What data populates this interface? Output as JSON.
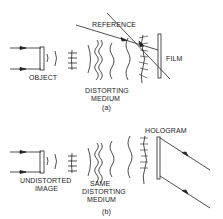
{
  "panel_a": {
    "caption": "(a)",
    "labels": {
      "object": "OBJECT",
      "distorting_medium_line1": "DISTORTING",
      "distorting_medium_line2": "MEDIUM",
      "reference": "REFERENCE",
      "film": "FILM"
    }
  },
  "panel_b": {
    "caption": "(b)",
    "labels": {
      "undistorted_line1": "UNDISTORTED",
      "undistorted_line2": "IMAGE",
      "same_line1": "SAME",
      "same_line2": "DISTORTING",
      "same_line3": "MEDIUM",
      "hologram": "HOLOGRAM"
    }
  },
  "colors": {
    "ink": "#222222",
    "background": "#ffffff"
  }
}
